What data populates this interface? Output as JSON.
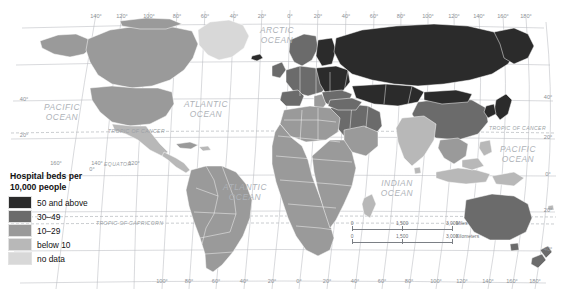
{
  "map": {
    "title": "Hospital beds per 10,000 people",
    "legend": {
      "title_line1": "Hospital beds per",
      "title_line2": "10,000 people",
      "items": [
        {
          "label": "50 and above",
          "color": "#2b2b2b"
        },
        {
          "label": "30–49",
          "color": "#6b6b6b"
        },
        {
          "label": "10–29",
          "color": "#9a9a9a"
        },
        {
          "label": "below 10",
          "color": "#b8b8b8"
        },
        {
          "label": "no data",
          "color": "#d8d8d8"
        }
      ]
    },
    "scalebars": [
      {
        "unit": "Miles",
        "ticks": [
          "0",
          "1,500",
          "3,000"
        ]
      },
      {
        "unit": "Kilometers",
        "ticks": [
          "0",
          "1,500",
          "3,000"
        ]
      }
    ],
    "ocean_labels": [
      {
        "name": "arctic-ocean",
        "line1": "ARCTIC",
        "line2": "OCEAN",
        "x": 277,
        "y": 33
      },
      {
        "name": "pacific-ocean-west",
        "line1": "PACIFIC",
        "line2": "OCEAN",
        "x": 62,
        "y": 110
      },
      {
        "name": "atlantic-ocean-north",
        "line1": "ATLANTIC",
        "line2": "OCEAN",
        "x": 206,
        "y": 107
      },
      {
        "name": "atlantic-ocean-south",
        "line1": "ATLANTIC",
        "line2": "OCEAN",
        "x": 245,
        "y": 190
      },
      {
        "name": "indian-ocean",
        "line1": "INDIAN",
        "line2": "OCEAN",
        "x": 397,
        "y": 186
      },
      {
        "name": "pacific-ocean-east",
        "line1": "PACIFIC",
        "line2": "OCEAN",
        "x": 518,
        "y": 152
      }
    ],
    "reference_lines": [
      {
        "name": "tropic-of-cancer-left",
        "label": "TROPIC OF CANCER",
        "x": 108,
        "y": 133
      },
      {
        "name": "tropic-of-cancer-right",
        "label": "TROPIC OF CANCER",
        "x": 489,
        "y": 130
      },
      {
        "name": "equator",
        "label": "EQUATOR",
        "x": 104,
        "y": 166
      },
      {
        "name": "tropic-of-capricorn-left",
        "label": "TROPIC OF CAPRICORN",
        "x": 96,
        "y": 225
      }
    ],
    "longitude_labels_top": [
      {
        "v": "140°",
        "x": 96
      },
      {
        "v": "120°",
        "x": 122
      },
      {
        "v": "100°",
        "x": 149
      },
      {
        "v": "80°",
        "x": 177
      },
      {
        "v": "60°",
        "x": 205
      },
      {
        "v": "40°",
        "x": 234
      },
      {
        "v": "20°",
        "x": 262
      },
      {
        "v": "0°",
        "x": 290
      },
      {
        "v": "20°",
        "x": 318
      },
      {
        "v": "40°",
        "x": 346
      },
      {
        "v": "60°",
        "x": 374
      },
      {
        "v": "80°",
        "x": 401
      },
      {
        "v": "100°",
        "x": 428
      },
      {
        "v": "120°",
        "x": 454
      },
      {
        "v": "140°",
        "x": 479
      },
      {
        "v": "160°",
        "x": 503
      },
      {
        "v": "180°",
        "x": 526
      }
    ],
    "longitude_labels_bottom": [
      {
        "v": "100°",
        "x": 162
      },
      {
        "v": "80°",
        "x": 189
      },
      {
        "v": "60°",
        "x": 216
      },
      {
        "v": "40°",
        "x": 244
      },
      {
        "v": "20°",
        "x": 272
      },
      {
        "v": "0°",
        "x": 299
      },
      {
        "v": "20°",
        "x": 327
      },
      {
        "v": "40°",
        "x": 355
      },
      {
        "v": "60°",
        "x": 382
      },
      {
        "v": "80°",
        "x": 409
      },
      {
        "v": "100°",
        "x": 436
      },
      {
        "v": "120°",
        "x": 462
      },
      {
        "v": "140°",
        "x": 488
      },
      {
        "v": "160°",
        "x": 512
      },
      {
        "v": "180°",
        "x": 535
      }
    ],
    "longitude_labels_lower_left": [
      {
        "v": "160°",
        "x": 56
      },
      {
        "v": "140°",
        "x": 97
      },
      {
        "v": "120°",
        "x": 134
      }
    ],
    "latitude_labels_left": [
      {
        "v": "40°",
        "x": 24,
        "y": 101
      },
      {
        "v": "20°",
        "x": 24,
        "y": 137
      },
      {
        "v": "0°",
        "x": 92,
        "y": 171
      }
    ],
    "latitude_labels_right": [
      {
        "v": "40°",
        "x": 548,
        "y": 99
      },
      {
        "v": "20°",
        "x": 548,
        "y": 139
      },
      {
        "v": "0°",
        "x": 548,
        "y": 176
      },
      {
        "v": "20°",
        "x": 548,
        "y": 212
      },
      {
        "v": "40°",
        "x": 548,
        "y": 251
      }
    ]
  }
}
